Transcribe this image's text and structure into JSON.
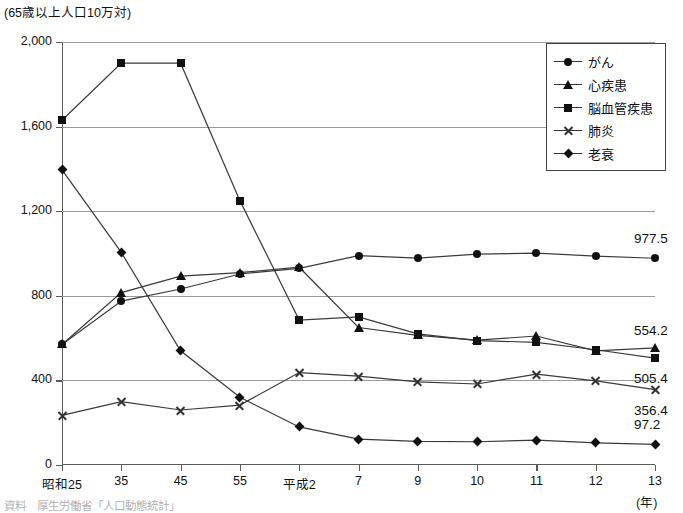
{
  "caption": {
    "unit_note": "(65歳以上人口10万対)",
    "x_unit": "(年)"
  },
  "legend": {
    "items": [
      {
        "label": "がん",
        "marker": "circle-marker"
      },
      {
        "label": "心疾患",
        "marker": "triangle-marker"
      },
      {
        "label": "脳血管疾患",
        "marker": "square-marker"
      },
      {
        "label": "肺炎",
        "marker": "x-marker"
      },
      {
        "label": "老衰",
        "marker": "diamond-marker"
      }
    ]
  },
  "end_labels": [
    {
      "text": "977.5",
      "series": "がん"
    },
    {
      "text": "554.2",
      "series": "心疾患"
    },
    {
      "text": "505.4",
      "series": "脳血管疾患"
    },
    {
      "text": "356.4",
      "series": "肺炎"
    },
    {
      "text": "97.2",
      "series": "老衰"
    }
  ],
  "footnote": "資料　厚生労働省「人口動態統計」",
  "chart_data": {
    "type": "line",
    "title": "",
    "xlabel": "(年)",
    "ylabel": "(65歳以上人口10万対)",
    "ylim": [
      0,
      2000
    ],
    "yticks": [
      "0",
      "400",
      "800",
      "1,200",
      "1,600",
      "2,000"
    ],
    "ytick_values": [
      0,
      400,
      800,
      1200,
      1600,
      2000
    ],
    "grid": true,
    "legend_position": "top-right",
    "categories": [
      "昭和25",
      "35",
      "45",
      "55",
      "平成2",
      "7",
      "9",
      "10",
      "11",
      "12",
      "13"
    ],
    "series": [
      {
        "name": "がん",
        "marker": "circle",
        "values": [
          570,
          775,
          832,
          903,
          930,
          990,
          978,
          997,
          1002,
          988,
          977.5
        ],
        "end_value": 977.5
      },
      {
        "name": "心疾患",
        "marker": "triangle",
        "values": [
          570,
          815,
          893,
          910,
          935,
          650,
          613,
          590,
          610,
          540,
          554.2
        ],
        "end_value": 554.2
      },
      {
        "name": "脳血管疾患",
        "marker": "square",
        "values": [
          1630,
          1900,
          1900,
          1250,
          685,
          700,
          620,
          588,
          580,
          545,
          505.4
        ],
        "end_value": 505.4
      },
      {
        "name": "肺炎",
        "marker": "x",
        "values": [
          235,
          300,
          260,
          283,
          437,
          420,
          393,
          383,
          430,
          398,
          356.4
        ],
        "end_value": 356.4
      },
      {
        "name": "老衰",
        "marker": "diamond",
        "values": [
          1395,
          1005,
          540,
          320,
          180,
          122,
          112,
          110,
          118,
          105,
          97.2
        ],
        "end_value": 97.2
      }
    ]
  }
}
